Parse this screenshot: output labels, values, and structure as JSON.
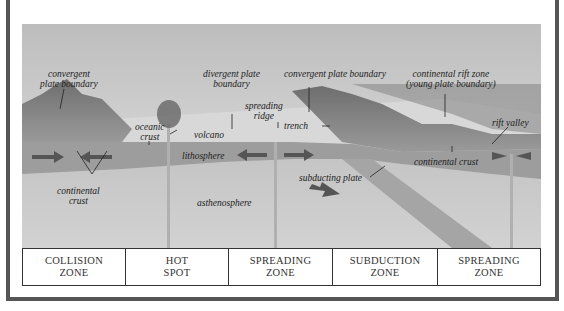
{
  "colors": {
    "frame": "#555555",
    "sky": "#c9c9c9",
    "ocean_surface": "#dcdcdc",
    "lithosphere": "#9a9a9a",
    "asthenosphere": "#c4c4c4",
    "mountains": "#7d7d7d",
    "arrows": "#555555",
    "table_border": "#333333"
  },
  "labels": {
    "convergent_left": [
      "convergent",
      "plate boundary"
    ],
    "oceanic_crust": [
      "oceanic",
      "crust"
    ],
    "volcano": "volcano",
    "divergent": [
      "divergent plate",
      "boundary"
    ],
    "spreading_ridge": [
      "spreading",
      "ridge"
    ],
    "convergent_right": "convergent plate boundary",
    "trench": "trench",
    "rift_zone": [
      "continental rift zone",
      "(young plate boundary)"
    ],
    "rift_valley": "rift valley",
    "lithosphere": "lithosphere",
    "continental_crust_left": [
      "continental",
      "crust"
    ],
    "asthenosphere": "asthenosphere",
    "subducting_plate": "subducting plate",
    "continental_crust_right": "continental crust"
  },
  "zones": [
    {
      "line1": "COLLISION",
      "line2": "ZONE"
    },
    {
      "line1": "HOT",
      "line2": "SPOT"
    },
    {
      "line1": "SPREADING",
      "line2": "ZONE"
    },
    {
      "line1": "SUBDUCTION",
      "line2": "ZONE"
    },
    {
      "line1": "SPREADING",
      "line2": "ZONE"
    }
  ]
}
